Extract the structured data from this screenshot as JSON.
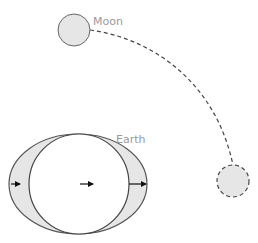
{
  "diagram": {
    "type": "tidal-bulge",
    "labels": {
      "moon": "Moon",
      "earth": "Earth"
    },
    "colors": {
      "fill_gray": "#e6e6e6",
      "stroke": "#555555",
      "label": "#9a9a9a",
      "arrow": "#111111"
    },
    "elements": [
      {
        "name": "moon",
        "style": "solid",
        "shape": "circle"
      },
      {
        "name": "moon-later-position",
        "style": "dashed",
        "shape": "circle"
      },
      {
        "name": "moon-orbit-path",
        "style": "dashed",
        "shape": "arc"
      },
      {
        "name": "earth",
        "shape": "circle"
      },
      {
        "name": "tidal-bulge",
        "shape": "ellipse"
      },
      {
        "name": "force-arrows",
        "count": 3,
        "direction": "right"
      }
    ]
  }
}
